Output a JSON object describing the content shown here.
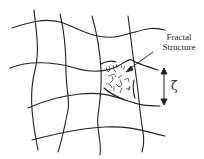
{
  "diagram": {
    "type": "network-schematic",
    "labels": {
      "fractal_line1": "Fractal",
      "fractal_line2": "Structure",
      "length_scale": "ζ"
    },
    "colors": {
      "line": "#222222",
      "background": "#ffffff"
    }
  }
}
